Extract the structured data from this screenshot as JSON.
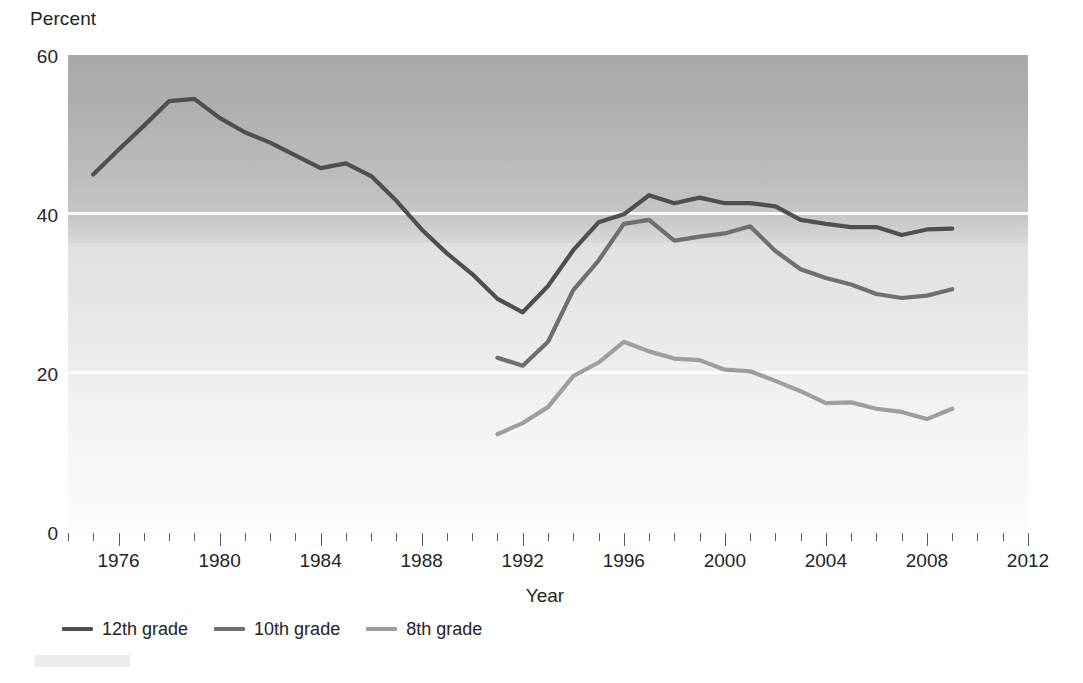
{
  "chart_data": {
    "type": "line",
    "title": "",
    "xlabel": "Year",
    "ylabel": "Percent",
    "xlim": [
      1974,
      2012
    ],
    "ylim": [
      0,
      60
    ],
    "grid": "horizontal white gridlines at 20 and 40",
    "legend_position": "below-left",
    "y_ticks": [
      0,
      20,
      40,
      60
    ],
    "x_ticks_labeled": [
      1976,
      1980,
      1984,
      1988,
      1992,
      1996,
      2000,
      2004,
      2008,
      2012
    ],
    "x_ticks_all": [
      1974,
      1975,
      1976,
      1977,
      1978,
      1979,
      1980,
      1981,
      1982,
      1983,
      1984,
      1985,
      1986,
      1987,
      1988,
      1989,
      1990,
      1991,
      1992,
      1993,
      1994,
      1995,
      1996,
      1997,
      1998,
      1999,
      2000,
      2001,
      2002,
      2003,
      2004,
      2005,
      2006,
      2007,
      2008,
      2009,
      2010,
      2011,
      2012
    ],
    "series": [
      {
        "name": "12th grade",
        "color": "#4f4f4f",
        "x": [
          1975,
          1976,
          1977,
          1978,
          1979,
          1980,
          1981,
          1982,
          1983,
          1984,
          1985,
          1986,
          1987,
          1988,
          1989,
          1990,
          1991,
          1992,
          1993,
          1994,
          1995,
          1996,
          1997,
          1998,
          1999,
          2000,
          2001,
          2002,
          2003,
          2004,
          2005,
          2006,
          2007,
          2008,
          2009
        ],
        "values": [
          45.0,
          48.1,
          51.1,
          54.2,
          54.5,
          52.1,
          50.3,
          49.0,
          47.4,
          45.8,
          46.4,
          44.8,
          41.7,
          38.1,
          35.1,
          32.5,
          29.4,
          27.7,
          31.0,
          35.5,
          39.0,
          40.0,
          42.4,
          41.4,
          42.1,
          41.4,
          41.4,
          41.0,
          39.3,
          38.8,
          38.4,
          38.4,
          37.4,
          38.1,
          38.2
        ]
      },
      {
        "name": "10th grade",
        "color": "#6f6f6f",
        "x": [
          1991,
          1992,
          1993,
          1994,
          1995,
          1996,
          1997,
          1998,
          1999,
          2000,
          2001,
          2002,
          2003,
          2004,
          2005,
          2006,
          2007,
          2008,
          2009
        ],
        "values": [
          22.0,
          21.0,
          24.0,
          30.5,
          34.2,
          38.8,
          39.3,
          36.7,
          37.2,
          37.6,
          38.5,
          35.4,
          33.1,
          32.0,
          31.2,
          30.0,
          29.5,
          29.8,
          30.6
        ]
      },
      {
        "name": "8th grade",
        "color": "#9e9e9e",
        "x": [
          1991,
          1992,
          1993,
          1994,
          1995,
          1996,
          1997,
          1998,
          1999,
          2000,
          2001,
          2002,
          2003,
          2004,
          2005,
          2006,
          2007,
          2008,
          2009
        ],
        "values": [
          12.4,
          13.8,
          15.8,
          19.7,
          21.4,
          24.0,
          22.8,
          21.9,
          21.7,
          20.5,
          20.3,
          19.1,
          17.8,
          16.3,
          16.4,
          15.6,
          15.2,
          14.3,
          15.6
        ]
      }
    ]
  },
  "axes": {
    "y_title": "Percent",
    "x_title": "Year",
    "y_tick_labels": [
      "60",
      "40",
      "20",
      "0"
    ],
    "x_tick_labels": [
      "1976",
      "1980",
      "1984",
      "1988",
      "1992",
      "1996",
      "2000",
      "2004",
      "2008",
      "2012"
    ]
  },
  "legend": {
    "items": [
      {
        "label": "12th grade",
        "color": "#4f4f4f"
      },
      {
        "label": "10th grade",
        "color": "#6f6f6f"
      },
      {
        "label": "8th grade",
        "color": "#9e9e9e"
      }
    ]
  },
  "colors": {
    "grade12": "#4f4f4f",
    "grade10": "#6f6f6f",
    "grade8": "#9e9e9e",
    "gridline": "#ffffff",
    "text": "#242424",
    "plot_top": "#a9a9a9",
    "plot_bottom": "#fcfcfc"
  }
}
